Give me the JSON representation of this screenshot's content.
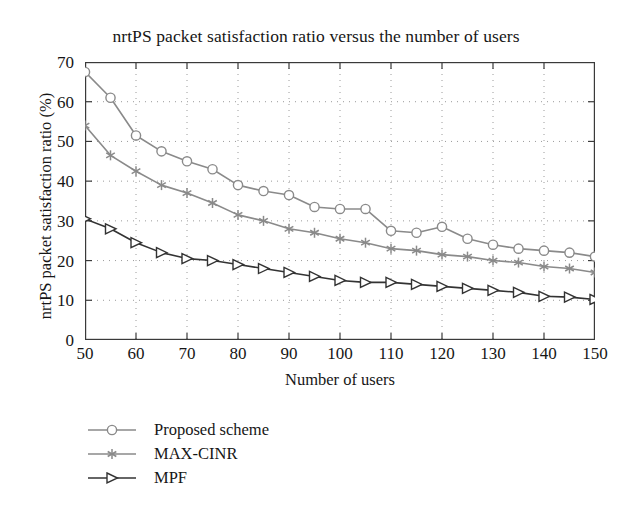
{
  "chart_data": {
    "type": "line",
    "title": "nrtPS packet satisfaction ratio versus the number of users",
    "xlabel": "Number of users",
    "ylabel": "nrtPS packet satisfaction ratio (%)",
    "xlim": [
      50,
      150
    ],
    "ylim": [
      0,
      70
    ],
    "xticks": [
      50,
      60,
      70,
      80,
      90,
      100,
      110,
      120,
      130,
      140,
      150
    ],
    "yticks": [
      0,
      10,
      20,
      30,
      40,
      50,
      60,
      70
    ],
    "grid": true,
    "legend_position": "below-left",
    "x": [
      50,
      55,
      60,
      65,
      70,
      75,
      80,
      85,
      90,
      95,
      100,
      105,
      110,
      115,
      120,
      125,
      130,
      135,
      140,
      145,
      150
    ],
    "series": [
      {
        "name": "Proposed scheme",
        "marker": "circle",
        "color": "#8a8a8a",
        "values": [
          67.5,
          61.0,
          51.5,
          47.5,
          45.0,
          43.0,
          39.0,
          37.5,
          36.5,
          33.5,
          33.0,
          33.0,
          27.5,
          27.0,
          28.5,
          25.5,
          24.0,
          23.0,
          22.5,
          22.0,
          21.0
        ]
      },
      {
        "name": "MAX-CINR",
        "marker": "asterisk",
        "color": "#8a8a8a",
        "values": [
          54.0,
          46.5,
          42.5,
          39.0,
          37.0,
          34.5,
          31.5,
          30.0,
          28.0,
          27.0,
          25.5,
          24.5,
          23.0,
          22.5,
          21.5,
          21.0,
          20.0,
          19.5,
          18.5,
          18.0,
          17.0
        ]
      },
      {
        "name": "MPF",
        "marker": "triangle-right",
        "color": "#333333",
        "values": [
          30.5,
          28.0,
          24.5,
          22.0,
          20.5,
          20.0,
          19.0,
          18.0,
          17.0,
          16.0,
          15.0,
          14.5,
          14.5,
          14.0,
          13.5,
          13.0,
          12.5,
          12.0,
          11.0,
          10.8,
          10.2
        ]
      }
    ]
  },
  "legend": {
    "items": [
      {
        "label": "Proposed scheme"
      },
      {
        "label": "MAX-CINR"
      },
      {
        "label": "MPF"
      }
    ]
  },
  "axis": {
    "frame_color": "#3a3a3a",
    "grid_color": "#9a9a9a"
  }
}
